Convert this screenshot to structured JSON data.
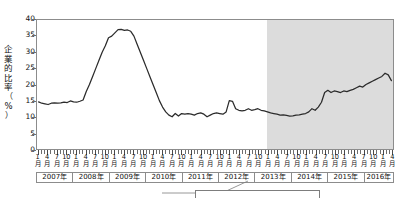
{
  "chart_data": {
    "type": "line",
    "title": "",
    "subtitle": "",
    "xlabel": "",
    "ylabel": "企業的比率（%）",
    "ylim": [
      0,
      40
    ],
    "yticks": [
      0,
      5,
      10,
      15,
      20,
      25,
      30,
      35,
      40
    ],
    "grid": false,
    "legend": "none",
    "x_tick_labels": [
      "1月",
      "4月",
      "7月",
      "10月"
    ],
    "x_major_period": "monthly",
    "x_start": "2007-01",
    "x_end": "2016-04",
    "year_labels": [
      "2007年",
      "2008年",
      "2009年",
      "2010年",
      "2011年",
      "2012年",
      "2013年",
      "2014年",
      "2015年",
      "2016年"
    ],
    "year_spans_months": [
      12,
      12,
      12,
      12,
      12,
      12,
      12,
      12,
      12,
      4
    ],
    "shaded_region": {
      "from": "2013-01",
      "to": "2016-04",
      "color": "#dcdcdc"
    },
    "line_color": "#2b2b2b",
    "series": [
      {
        "name": "企業的比率",
        "x": [
          "2007-01",
          "2007-02",
          "2007-03",
          "2007-04",
          "2007-05",
          "2007-06",
          "2007-07",
          "2007-08",
          "2007-09",
          "2007-10",
          "2007-11",
          "2007-12",
          "2008-01",
          "2008-02",
          "2008-03",
          "2008-04",
          "2008-05",
          "2008-06",
          "2008-07",
          "2008-08",
          "2008-09",
          "2008-10",
          "2008-11",
          "2008-12",
          "2009-01",
          "2009-02",
          "2009-03",
          "2009-04",
          "2009-05",
          "2009-06",
          "2009-07",
          "2009-08",
          "2009-09",
          "2009-10",
          "2009-11",
          "2009-12",
          "2010-01",
          "2010-02",
          "2010-03",
          "2010-04",
          "2010-05",
          "2010-06",
          "2010-07",
          "2010-08",
          "2010-09",
          "2010-10",
          "2010-11",
          "2010-12",
          "2011-01",
          "2011-02",
          "2011-03",
          "2011-04",
          "2011-05",
          "2011-06",
          "2011-07",
          "2011-08",
          "2011-09",
          "2011-10",
          "2011-11",
          "2011-12",
          "2012-01",
          "2012-02",
          "2012-03",
          "2012-04",
          "2012-05",
          "2012-06",
          "2012-07",
          "2012-08",
          "2012-09",
          "2012-10",
          "2012-11",
          "2012-12",
          "2013-01",
          "2013-02",
          "2013-03",
          "2013-04",
          "2013-05",
          "2013-06",
          "2013-07",
          "2013-08",
          "2013-09",
          "2013-10",
          "2013-11",
          "2013-12",
          "2014-01",
          "2014-02",
          "2014-03",
          "2014-04",
          "2014-05",
          "2014-06",
          "2014-07",
          "2014-08",
          "2014-09",
          "2014-10",
          "2014-11",
          "2014-12",
          "2015-01",
          "2015-02",
          "2015-03",
          "2015-04",
          "2015-05",
          "2015-06",
          "2015-07",
          "2015-08",
          "2015-09",
          "2015-10",
          "2015-11",
          "2015-12",
          "2016-01",
          "2016-02",
          "2016-03",
          "2016-04"
        ],
        "values": [
          14.6,
          14.2,
          14.0,
          13.8,
          14.2,
          14.3,
          14.2,
          14.3,
          14.5,
          14.4,
          14.9,
          14.6,
          14.5,
          14.8,
          15.2,
          17.8,
          20.0,
          22.5,
          25.0,
          27.5,
          30.0,
          32.0,
          34.5,
          35.0,
          36.0,
          37.0,
          37.1,
          36.8,
          36.9,
          36.5,
          35.0,
          32.5,
          30.0,
          27.5,
          25.0,
          22.5,
          20.0,
          17.5,
          15.0,
          13.0,
          11.5,
          10.5,
          10.0,
          11.0,
          10.2,
          11.0,
          10.8,
          11.0,
          10.8,
          10.5,
          11.0,
          11.2,
          10.8,
          10.0,
          10.5,
          11.0,
          11.2,
          11.0,
          10.8,
          11.5,
          15.0,
          14.8,
          12.5,
          12.0,
          11.8,
          12.0,
          12.5,
          12.0,
          12.2,
          12.5,
          12.0,
          11.8,
          11.5,
          11.2,
          11.0,
          10.8,
          10.5,
          10.6,
          10.4,
          10.2,
          10.3,
          10.5,
          10.6,
          10.8,
          11.0,
          11.5,
          12.5,
          12.0,
          13.0,
          14.5,
          17.5,
          18.2,
          17.5,
          18.0,
          17.8,
          17.5,
          18.0,
          17.8,
          18.2,
          18.5,
          19.0,
          19.5,
          19.2,
          20.0,
          20.5,
          21.0,
          21.5,
          22.0,
          22.5,
          23.5,
          23.0,
          21.2
        ]
      }
    ]
  },
  "annotation": {
    "callout_text": ""
  }
}
